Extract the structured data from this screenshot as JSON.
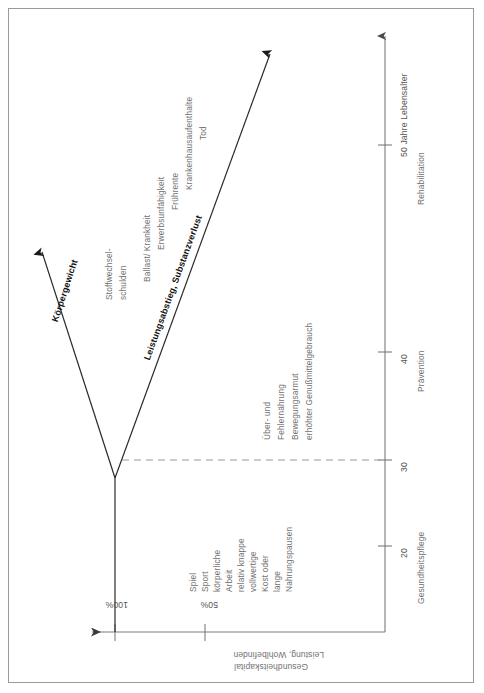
{
  "figure": {
    "title_hidden": "",
    "y_axis": {
      "name": "axis-wellbeing",
      "label_line1": "Gesundheitskapital",
      "label_line2": "Leistung, Wohlbefinden",
      "ticks": [
        "100%",
        "50%"
      ]
    },
    "x_axis": {
      "name": "axis-age",
      "ticks": [
        "20",
        "30",
        "40",
        "50 Jahre Lebensalter"
      ],
      "stages": [
        "Gesundheitspflege",
        "Prävention",
        "Rehabilitation"
      ]
    },
    "curves": {
      "upper_label": "Körpergewicht",
      "lower_label": "Leistungsabstieg, Substanzverlust"
    },
    "annotations": {
      "healthy_block": [
        "Spiel",
        "Sport",
        "körperliche",
        "Arbeit",
        "relativ knappe",
        "vollwertige",
        "Kost oder",
        "lange",
        "Nahrungspausen"
      ],
      "risk_block": [
        "Über- und",
        "Fehlernährung",
        "Bewegungsarmut",
        "erhöhter Genußmittelgebrauch"
      ],
      "debt_block": [
        "Stoffwechsel-",
        "schulden"
      ],
      "outcome_block": [
        "Ballast/ Krankheit",
        "Erwerbsunfähigkeit",
        "Frührente",
        "Krankenhausaufenthalte",
        "Tod"
      ]
    },
    "colors": {
      "frame": "#9a9a9a",
      "axis": "#7b7b7b",
      "curve": "#2a2a2a",
      "dashed": "#9a9a9a",
      "text_gray": "#6f6f6f",
      "text_dark": "#1c1c1c"
    }
  }
}
